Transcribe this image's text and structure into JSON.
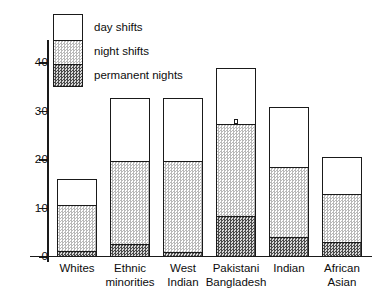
{
  "chart_data": {
    "type": "bar",
    "title": "",
    "subtitle": "",
    "xlabel": "",
    "ylabel": "",
    "stacked": true,
    "grid": false,
    "legend_position": "inside-top-left",
    "ylim": [
      0,
      44
    ],
    "yticks": [
      0,
      10,
      20,
      30,
      40
    ],
    "ytick_labels": [
      "0",
      "10",
      "20",
      "30",
      "40"
    ],
    "categories": [
      "Whites",
      "Ethnic minorities",
      "West Indian",
      "Pakistani Bangladesh",
      "Indian",
      "African Asian"
    ],
    "category_lines": [
      [
        "Whites"
      ],
      [
        "Ethnic",
        "minorities"
      ],
      [
        "West",
        "Indian"
      ],
      [
        "Pakistani",
        "Bangladesh"
      ],
      [
        "Indian"
      ],
      [
        "African",
        "Asian"
      ]
    ],
    "series": [
      {
        "name": "permanent nights",
        "values": [
          1.2,
          2.7,
          1.0,
          8.5,
          4.1,
          3.0
        ]
      },
      {
        "name": "night shifts",
        "values": [
          9.6,
          17.0,
          18.7,
          19.0,
          14.5,
          10.0
        ]
      },
      {
        "name": "day shifts",
        "values": [
          5.0,
          12.8,
          12.8,
          11.3,
          12.1,
          7.4
        ]
      }
    ],
    "cumulative_tops": {
      "permanent nights": [
        1.2,
        2.7,
        1.0,
        8.5,
        4.1,
        3.0
      ],
      "night shifts": [
        10.8,
        19.7,
        19.7,
        27.5,
        18.6,
        13.0
      ],
      "day shifts": [
        15.8,
        32.5,
        32.5,
        38.8,
        30.7,
        20.4
      ]
    },
    "annotations": [
      {
        "category": "Pakistani Bangladesh",
        "type": "tick-notch",
        "at_value": 27.5
      }
    ]
  },
  "legend": {
    "items": [
      {
        "label": "day shifts",
        "swatch": "white"
      },
      {
        "label": "night shifts",
        "swatch": "light-stipple"
      },
      {
        "label": "permanent nights",
        "swatch": "dark-stipple"
      }
    ]
  },
  "colors": {
    "ink": "#1a1a1a",
    "background": "#ffffff",
    "day_shifts": "#ffffff",
    "night_shifts": "#b9b9b9",
    "permanent_nights": "#4a4a4a"
  }
}
